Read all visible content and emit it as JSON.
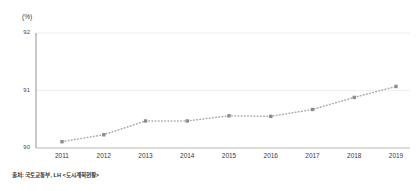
{
  "chart_data": {
    "type": "line",
    "title": "",
    "subtitle": "",
    "xlabel": "",
    "ylabel": "(%)",
    "unit_label": "(%)",
    "categories": [
      "2011",
      "2012",
      "2013",
      "2014",
      "2015",
      "2016",
      "2017",
      "2018",
      "2019"
    ],
    "values": [
      90.11,
      90.23,
      90.47,
      90.47,
      90.56,
      90.55,
      90.67,
      90.88,
      91.07
    ],
    "series": [
      {
        "name": "",
        "values": [
          90.11,
          90.23,
          90.47,
          90.47,
          90.56,
          90.55,
          90.67,
          90.88,
          91.07
        ]
      }
    ],
    "ylim": [
      90,
      92
    ],
    "yticks": [
      "90",
      "91",
      "92"
    ],
    "ytick_values": [
      90,
      91,
      92
    ],
    "grid": true,
    "grid_axis": "y",
    "legend": false,
    "legend_position": "none",
    "line_style": "dotted",
    "marker": "square",
    "marker_color": "#8c8c94",
    "line_color": "#a8a8b0",
    "axis_color": "#b0b0b0",
    "grid_color": "#e8e8ec",
    "text_color": "#3a3a3a"
  },
  "source": {
    "note": "출처: 국토교통부, LH <도시계획현황>"
  }
}
